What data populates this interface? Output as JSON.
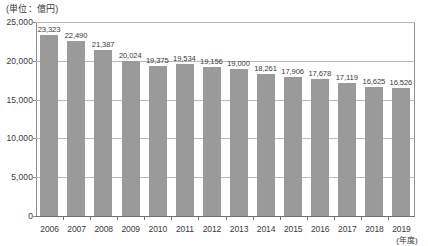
{
  "chart_data": {
    "type": "bar",
    "title": "",
    "unit_caption": "(単位：億円)",
    "xlabel": "(年度)",
    "ylabel": "",
    "ylim": [
      0,
      25000
    ],
    "ytick_values": [
      0,
      5000,
      10000,
      15000,
      20000,
      25000
    ],
    "ytick_labels": [
      "0",
      "5,000",
      "10,000",
      "15,000",
      "20,000",
      "25,000"
    ],
    "grid": true,
    "grid_axis": "y",
    "legend": false,
    "categories": [
      "2006",
      "2007",
      "2008",
      "2009",
      "2010",
      "2011",
      "2012",
      "2013",
      "2014",
      "2015",
      "2016",
      "2017",
      "2018",
      "2019"
    ],
    "values": [
      23323,
      22490,
      21387,
      20024,
      19375,
      19534,
      19156,
      19000,
      18261,
      17906,
      17678,
      17119,
      16625,
      16526
    ],
    "value_labels": [
      "23,323",
      "22,490",
      "21,387",
      "20,024",
      "19,375",
      "19,534",
      "19,156",
      "19,000",
      "18,261",
      "17,906",
      "17,678",
      "17,119",
      "16,625",
      "16,526"
    ],
    "bar_color": "#9a9a9a",
    "grid_color": "#b9b9b9",
    "axis_color": "#6f6f6f",
    "text_color": "#3a3a3a",
    "background_color": "#ffffff"
  }
}
